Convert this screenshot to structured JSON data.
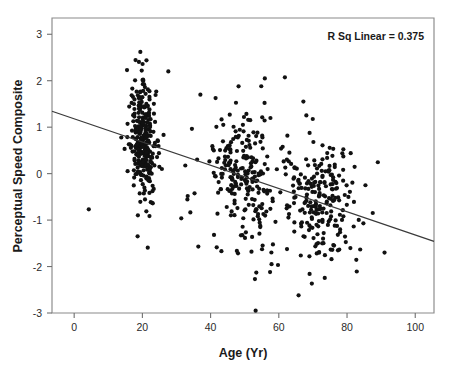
{
  "chart_data": {
    "type": "scatter",
    "title": "",
    "xlabel": "Age (Yr)",
    "ylabel": "Perceptual Speed Composite",
    "xlim": [
      -6.5,
      105.5
    ],
    "ylim": [
      -3.0,
      3.35
    ],
    "xticks": [
      0,
      20,
      40,
      60,
      80,
      100
    ],
    "xtick_labels": [
      "0",
      "20",
      "40",
      "60",
      "80",
      "100"
    ],
    "yticks": [
      3,
      2,
      1,
      0,
      -1,
      -2,
      -3
    ],
    "ytick_labels": [
      "3",
      "2",
      "1",
      "0",
      "-1",
      "-2",
      "-3"
    ],
    "grid": false,
    "legend": null,
    "annotations": [
      {
        "name": "r-squared-annotation",
        "text": "R Sq Linear = 0.375",
        "x": 96,
        "y": 2.82,
        "align": "right"
      }
    ],
    "fit_line": {
      "name": "linear-regression-line",
      "r_squared": 0.375,
      "intercept": 1.18,
      "slope": -0.025,
      "x_start": -6.5,
      "y_start": 1.343,
      "x_end": 105.5,
      "y_end": -1.458
    },
    "marker": {
      "shape": "circle",
      "size_px": 2.1,
      "color": "#111111"
    },
    "series": [
      {
        "name": "Participants",
        "n_points": 760,
        "clusters": [
          {
            "label": "young-adults",
            "x_center": 20.4,
            "x_spread": 1.9,
            "y_center": 0.72,
            "y_spread": 0.62,
            "n": 300
          },
          {
            "label": "middle-aged",
            "x_center": 50.0,
            "x_spread": 5.0,
            "y_center": -0.08,
            "y_spread": 0.72,
            "n": 215
          },
          {
            "label": "older-adults",
            "x_center": 71.5,
            "x_spread": 5.6,
            "y_center": -0.55,
            "y_spread": 0.68,
            "n": 215
          },
          {
            "label": "scattered",
            "x_center": 48.0,
            "x_spread": 22.0,
            "y_center": 0.05,
            "y_spread": 0.95,
            "n": 30
          }
        ],
        "outliers": [
          {
            "x": 91.0,
            "y": -1.7
          },
          {
            "x": 84.8,
            "y": -1.07
          },
          {
            "x": 85.4,
            "y": -0.25
          },
          {
            "x": 53.2,
            "y": -2.95
          },
          {
            "x": 65.8,
            "y": -2.62
          },
          {
            "x": 53.0,
            "y": -2.27
          },
          {
            "x": 53.4,
            "y": -2.13
          },
          {
            "x": 19.4,
            "y": 2.62
          },
          {
            "x": 21.2,
            "y": 2.44
          },
          {
            "x": 27.6,
            "y": 2.2
          },
          {
            "x": 55.9,
            "y": 2.05
          },
          {
            "x": 48.2,
            "y": 1.88
          },
          {
            "x": 37.0,
            "y": 1.7
          },
          {
            "x": 67.2,
            "y": 1.55
          },
          {
            "x": 36.4,
            "y": -1.57
          },
          {
            "x": 41.0,
            "y": -1.32
          },
          {
            "x": 18.6,
            "y": -1.35
          }
        ]
      }
    ]
  },
  "figure": {
    "plot_area": {
      "left": 52,
      "top": 18,
      "right": 434,
      "bottom": 313
    },
    "background": "#ffffff",
    "frame_color": "#8a8a8a",
    "marker_color": "#111111",
    "line_color": "#3a3a3a",
    "text_color": "#1a1a1a"
  }
}
